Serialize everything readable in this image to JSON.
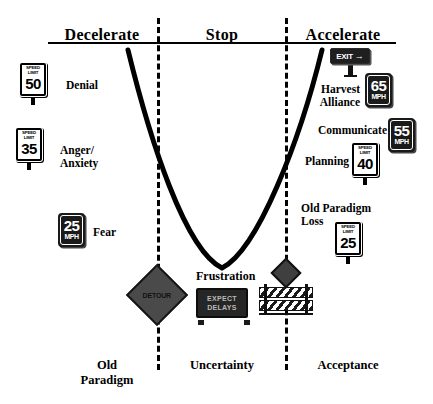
{
  "diagram": {
    "header": {
      "phases": [
        {
          "label": "Decelerate"
        },
        {
          "label": "Stop"
        },
        {
          "label": "Accelerate"
        }
      ]
    },
    "bottom_labels": [
      {
        "line1": "Old",
        "line2": "Paradigm"
      },
      {
        "line1": "Uncertainty",
        "line2": ""
      },
      {
        "line1": "Acceptance",
        "line2": ""
      }
    ],
    "left_stages": [
      {
        "label": "Denial",
        "sign": {
          "kind": "speed-limit",
          "top": "SPEED LIMIT",
          "number": "50"
        }
      },
      {
        "label_line1": "Anger/",
        "label_line2": "Anxiety",
        "sign": {
          "kind": "speed-limit",
          "top": "SPEED LIMIT",
          "number": "35"
        }
      },
      {
        "label": "Fear",
        "sign": {
          "kind": "mph",
          "number": "25",
          "unit": "MPH"
        }
      }
    ],
    "right_stages": [
      {
        "label_line1": "Harvest",
        "label_line2": "Alliance",
        "sign": {
          "kind": "mph",
          "number": "65",
          "unit": "MPH"
        }
      },
      {
        "label": "Communicate",
        "sign": {
          "kind": "mph",
          "number": "55",
          "unit": "MPH"
        }
      },
      {
        "label": "Planning",
        "sign": {
          "kind": "speed-limit",
          "top": "SPEED LIMIT",
          "number": "40"
        }
      },
      {
        "label_line1": "Old Paradigm",
        "label_line2": "Loss",
        "sign": {
          "kind": "speed-limit",
          "top": "SPEED LIMIT",
          "number": "25"
        }
      }
    ],
    "exit_sign": {
      "text": "EXIT",
      "arrow": "→"
    },
    "center_stage": {
      "label": "Frustration",
      "board_line1": "EXPECT",
      "board_line2": "DELAYS"
    },
    "detour_sign": {
      "text": "DETOUR"
    },
    "colors": {
      "ink": "#000000",
      "paper": "#ffffff",
      "sign_dark": "#1a1a1a",
      "sign_gray": "#4a4a4a"
    }
  }
}
